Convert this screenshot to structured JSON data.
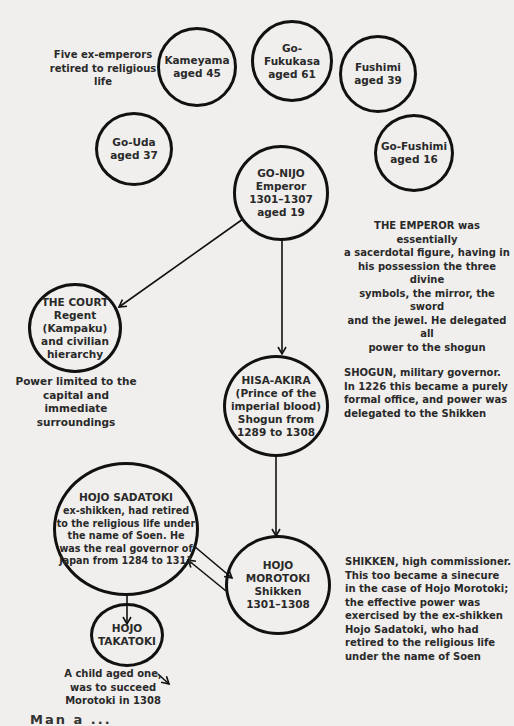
{
  "diagram": {
    "ex_emperors_label": [
      "Five ex-emperors",
      "retired to religious",
      "life"
    ],
    "nodes": {
      "kameyama": [
        "Kameyama",
        "aged 45"
      ],
      "go_fukakusa": [
        "Go-Fukukasa",
        "aged 61"
      ],
      "fushimi": [
        "Fushimi",
        "aged 39"
      ],
      "go_uda": [
        "Go-Uda",
        "aged 37"
      ],
      "go_fushimi": [
        "Go-Fushimi",
        "aged 16"
      ],
      "go_nijo": [
        "GO-NIJO",
        "Emperor",
        "1301–1307",
        "aged 19"
      ],
      "court": [
        "THE COURT",
        "Regent",
        "(Kampaku)",
        "and civilian",
        "hierarchy"
      ],
      "hisa_akira": [
        "HISA-AKIRA",
        "(Prince of the",
        "imperial blood)",
        "Shogun from",
        "1289 to 1308"
      ],
      "sadatoki": [
        "HOJO SADATOKI",
        "ex-shikken, had retired",
        "to the religious life under",
        "the name of Soen. He",
        "was the real governor of",
        "Japan from 1284 to 1311"
      ],
      "morotoki": [
        "HOJO",
        "MOROTOKI",
        "Shikken",
        "1301–1308"
      ],
      "takatoki": [
        "HOJO",
        "TAKATOKI"
      ]
    },
    "notes": {
      "emperor": [
        "THE EMPEROR was essentially",
        "a sacerdotal figure, having in",
        "his possession the three divine",
        "symbols, the mirror, the sword",
        "and the jewel. He delegated all",
        "power to the shogun"
      ],
      "court": [
        "Power limited to the",
        "capital and immediate",
        "surroundings"
      ],
      "shogun": [
        "SHOGUN, military governor.",
        "In 1226 this became a purely",
        "formal office, and power was",
        "delegated to the Shikken"
      ],
      "shikken": [
        "SHIKKEN, high commissioner.",
        "This too became a sinecure",
        "in the case of Hojo Morotoki;",
        "the effective power was",
        "exercised by the ex-shikken",
        "Hojo Sadatoki, who had",
        "retired to the religious life",
        "under the name of Soen"
      ],
      "takatoki": [
        "A child aged one,",
        "was to succeed",
        "Morotoki in 1308"
      ]
    },
    "cut_off_text": "Man  a   ...",
    "colors": {
      "background": "#f0efed",
      "ink": "#111111",
      "text": "#2a2a2a"
    }
  }
}
